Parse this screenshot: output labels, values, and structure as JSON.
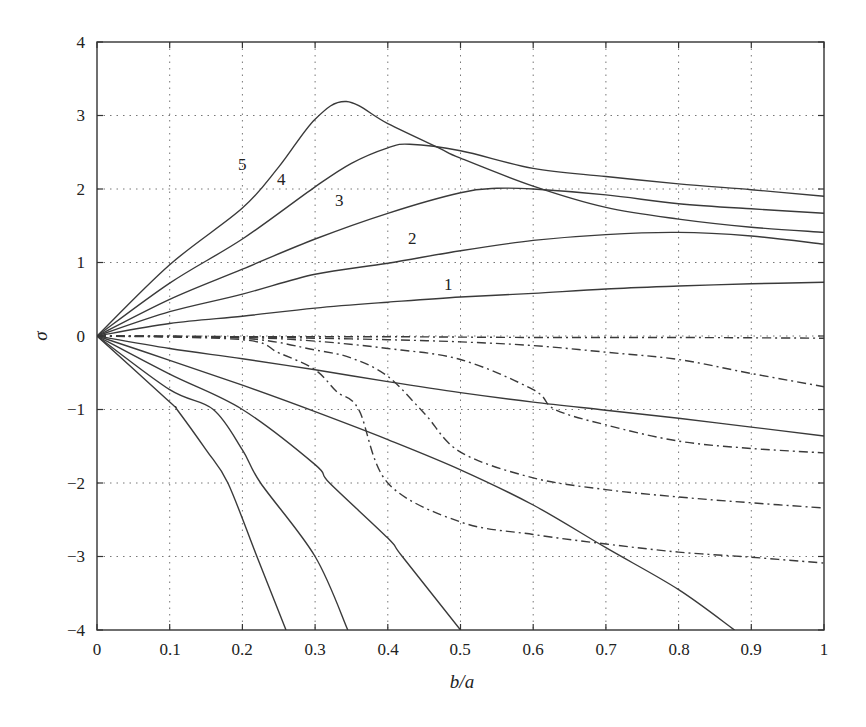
{
  "chart_data": {
    "type": "line",
    "title": "",
    "xlabel": "b/a",
    "ylabel": "σ",
    "xlim": [
      0,
      1
    ],
    "ylim": [
      -4,
      4
    ],
    "grid": true,
    "legend": "none (curves labelled inline 1–5)",
    "x_ticks": [
      "0",
      "0.1",
      "0.2",
      "0.3",
      "0.4",
      "0.5",
      "0.6",
      "0.7",
      "0.8",
      "0.9",
      "1"
    ],
    "y_ticks": [
      "4",
      "3",
      "2",
      "1",
      "0",
      "−1",
      "−2",
      "−3",
      "−4"
    ],
    "curve_labels": [
      {
        "text": "5",
        "x": 0.204,
        "y": 2.35
      },
      {
        "text": "4",
        "x": 0.256,
        "y": 2.12
      },
      {
        "text": "3",
        "x": 0.336,
        "y": 1.82
      },
      {
        "text": "2",
        "x": 0.437,
        "y": 1.3
      },
      {
        "text": "1",
        "x": 0.486,
        "y": 0.72
      }
    ],
    "series": [
      {
        "name": "1",
        "style": "solid",
        "x": [
          0,
          0.1,
          0.2,
          0.3,
          0.4,
          0.5,
          0.6,
          0.7,
          0.8,
          0.9,
          1.0
        ],
        "y": [
          0,
          0.17,
          0.27,
          0.38,
          0.46,
          0.53,
          0.58,
          0.64,
          0.68,
          0.71,
          0.73
        ]
      },
      {
        "name": "2",
        "style": "solid",
        "x": [
          0,
          0.1,
          0.2,
          0.3,
          0.4,
          0.5,
          0.6,
          0.7,
          0.8,
          0.9,
          1.0
        ],
        "y": [
          0,
          0.33,
          0.57,
          0.84,
          0.99,
          1.16,
          1.3,
          1.38,
          1.41,
          1.36,
          1.25
        ]
      },
      {
        "name": "3",
        "style": "solid",
        "x": [
          0,
          0.1,
          0.2,
          0.3,
          0.4,
          0.5,
          0.55,
          0.6,
          0.7,
          0.8,
          0.9,
          1.0
        ],
        "y": [
          0,
          0.5,
          0.91,
          1.32,
          1.67,
          1.95,
          2.01,
          2.0,
          1.92,
          1.8,
          1.73,
          1.67
        ]
      },
      {
        "name": "4",
        "style": "solid",
        "x": [
          0,
          0.1,
          0.2,
          0.3,
          0.35,
          0.4,
          0.43,
          0.5,
          0.6,
          0.7,
          0.8,
          0.9,
          1.0
        ],
        "y": [
          0,
          0.72,
          1.32,
          2.03,
          2.35,
          2.56,
          2.61,
          2.52,
          2.28,
          2.17,
          2.07,
          1.99,
          1.9
        ]
      },
      {
        "name": "5",
        "style": "solid",
        "x": [
          0,
          0.1,
          0.2,
          0.25,
          0.3,
          0.343,
          0.4,
          0.47,
          0.5,
          0.6,
          0.7,
          0.8,
          0.9,
          1.0
        ],
        "y": [
          0,
          0.97,
          1.74,
          2.3,
          2.95,
          3.19,
          2.89,
          2.56,
          2.42,
          2.04,
          1.75,
          1.59,
          1.48,
          1.41
        ]
      },
      {
        "name": "-1",
        "style": "solid",
        "x": [
          0,
          0.1,
          0.2,
          0.3,
          0.4,
          0.5,
          0.6,
          0.7,
          0.8,
          0.9,
          1.0
        ],
        "y": [
          0,
          -0.17,
          -0.31,
          -0.46,
          -0.62,
          -0.77,
          -0.9,
          -1.01,
          -1.12,
          -1.24,
          -1.36
        ]
      },
      {
        "name": "-2",
        "style": "solid",
        "x": [
          0,
          0.1,
          0.2,
          0.3,
          0.4,
          0.5,
          0.6,
          0.7,
          0.8,
          0.877
        ],
        "y": [
          0,
          -0.33,
          -0.67,
          -1.03,
          -1.41,
          -1.82,
          -2.3,
          -2.88,
          -3.45,
          -4.0
        ]
      },
      {
        "name": "-3",
        "style": "solid",
        "x": [
          0,
          0.1,
          0.2,
          0.3,
          0.32,
          0.4,
          0.42,
          0.5
        ],
        "y": [
          0,
          -0.52,
          -1.0,
          -1.75,
          -2.0,
          -2.75,
          -3.0,
          -4.0
        ]
      },
      {
        "name": "-4",
        "style": "solid",
        "x": [
          0,
          0.1,
          0.16,
          0.2,
          0.225,
          0.3,
          0.345
        ],
        "y": [
          0,
          -0.73,
          -1.0,
          -1.55,
          -2.0,
          -3.0,
          -4.0
        ]
      },
      {
        "name": "-5",
        "style": "solid",
        "x": [
          0,
          0.1,
          0.11,
          0.15,
          0.18,
          0.22,
          0.26
        ],
        "y": [
          0,
          -0.9,
          -1.0,
          -1.55,
          -2.0,
          -3.0,
          -4.0
        ]
      },
      {
        "name": "dd-a",
        "style": "dash-dot",
        "x": [
          0,
          0.2,
          0.4,
          0.6,
          0.8,
          1.0
        ],
        "y": [
          0,
          -0.01,
          -0.01,
          -0.02,
          -0.02,
          -0.03
        ]
      },
      {
        "name": "dd-b",
        "style": "dash-dot",
        "x": [
          0,
          0.2,
          0.3,
          0.4,
          0.5,
          0.6,
          0.7,
          0.8,
          0.9,
          1.0
        ],
        "y": [
          0,
          -0.01,
          -0.03,
          -0.05,
          -0.08,
          -0.13,
          -0.22,
          -0.32,
          -0.51,
          -0.69
        ]
      },
      {
        "name": "dd-c",
        "style": "dash-dot",
        "x": [
          0,
          0.2,
          0.3,
          0.4,
          0.5,
          0.6,
          0.63,
          0.7,
          0.8,
          0.9,
          1.0
        ],
        "y": [
          0,
          -0.02,
          -0.07,
          -0.17,
          -0.32,
          -0.73,
          -1.0,
          -1.21,
          -1.43,
          -1.53,
          -1.59
        ]
      },
      {
        "name": "dd-d",
        "style": "dash-dot",
        "x": [
          0,
          0.2,
          0.3,
          0.35,
          0.4,
          0.45,
          0.5,
          0.6,
          0.7,
          0.8,
          0.9,
          1.0
        ],
        "y": [
          0,
          -0.03,
          -0.19,
          -0.3,
          -0.55,
          -1.05,
          -1.58,
          -1.93,
          -2.09,
          -2.19,
          -2.27,
          -2.34
        ]
      },
      {
        "name": "dd-e",
        "style": "dash-dot",
        "x": [
          0,
          0.2,
          0.25,
          0.3,
          0.33,
          0.36,
          0.4,
          0.5,
          0.6,
          0.7,
          0.8,
          0.9,
          1.0
        ],
        "y": [
          0,
          -0.05,
          -0.23,
          -0.46,
          -0.76,
          -1.0,
          -2.0,
          -2.53,
          -2.7,
          -2.83,
          -2.94,
          -3.01,
          -3.09
        ]
      }
    ]
  },
  "plot": {
    "xlabel": "b/a",
    "ylabel": "σ",
    "x_ticks": [
      "0",
      "0.1",
      "0.2",
      "0.3",
      "0.4",
      "0.5",
      "0.6",
      "0.7",
      "0.8",
      "0.9",
      "1"
    ],
    "y_ticks": [
      "4",
      "3",
      "2",
      "1",
      "0",
      "−1",
      "−2",
      "−3",
      "−4"
    ],
    "curve_labels": [
      "5",
      "4",
      "3",
      "2",
      "1"
    ]
  }
}
